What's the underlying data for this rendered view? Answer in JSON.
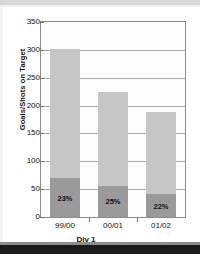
{
  "chart_data": {
    "type": "bar",
    "stacked": true,
    "title": "",
    "xlabel": "Div 1",
    "ylabel": "Goals/Shots on Target",
    "categories": [
      "99/00",
      "00/01",
      "01/02"
    ],
    "series": [
      {
        "name": "goals",
        "values": [
          70,
          56,
          41
        ],
        "color": "#9a9a9a"
      },
      {
        "name": "shots-remainder",
        "values": [
          231,
          169,
          147
        ],
        "color": "#c6c6c6"
      }
    ],
    "totals": [
      301,
      225,
      188
    ],
    "point_labels": [
      "23%",
      "25%",
      "22%"
    ],
    "ylim": [
      0,
      350
    ],
    "ytick_step": 50,
    "yticks": [
      "0",
      "50",
      "100",
      "150",
      "200",
      "250",
      "300",
      "350"
    ],
    "grid": true,
    "legend": "none"
  },
  "figure": {
    "plot_border_color": "#8b8b8b",
    "grid_color": "#a9a9a9",
    "background": "#ffffff"
  }
}
